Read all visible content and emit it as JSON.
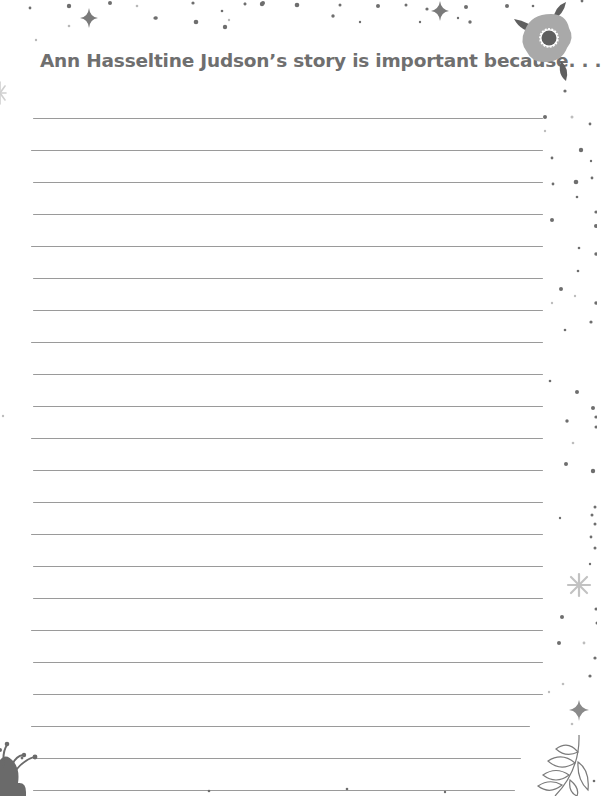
{
  "prompt": {
    "title": "Ann Hasseltine Judson’s story is important because. . ."
  },
  "writing_area": {
    "line_count": 22,
    "first_line_y": 118,
    "line_spacing": 32,
    "line_left_x": 32,
    "line_right_x": 543,
    "line_color": "#9a9a9a"
  },
  "decorations": {
    "top_right": "flower-icon",
    "bottom_left": "flower-icon",
    "bottom_right": "leaf-branch-icon",
    "sparkles": "sparkle-icon",
    "dots": "confetti-dots",
    "primary_gray": "#6f6f6f",
    "light_gray": "#b5b5b5"
  }
}
